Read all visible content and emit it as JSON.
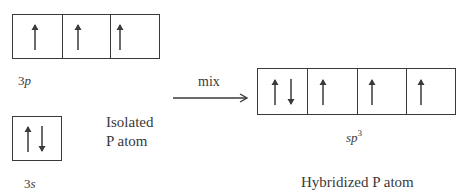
{
  "diagram": {
    "isolated": {
      "orbitals": [
        {
          "name": "3p",
          "label_main": "3",
          "label_italic": "p",
          "cells": [
            {
              "electrons": [
                "up"
              ]
            },
            {
              "electrons": [
                "up"
              ]
            },
            {
              "electrons": [
                "up"
              ]
            }
          ]
        },
        {
          "name": "3s",
          "label_main": "3",
          "label_italic": "s",
          "cells": [
            {
              "electrons": [
                "up",
                "down"
              ]
            }
          ]
        }
      ],
      "caption_line1": "Isolated",
      "caption_line2": "P atom"
    },
    "process": {
      "label": "mix"
    },
    "hybridized": {
      "orbital": {
        "name": "sp3",
        "label_italic": "sp",
        "label_sup": "3",
        "cells": [
          {
            "electrons": [
              "up",
              "down"
            ]
          },
          {
            "electrons": [
              "up"
            ]
          },
          {
            "electrons": [
              "up"
            ]
          },
          {
            "electrons": [
              "up"
            ]
          }
        ]
      },
      "caption": "Hybridized P atom"
    },
    "colors": {
      "line": "#3a3a3a",
      "background": "#ffffff"
    }
  }
}
